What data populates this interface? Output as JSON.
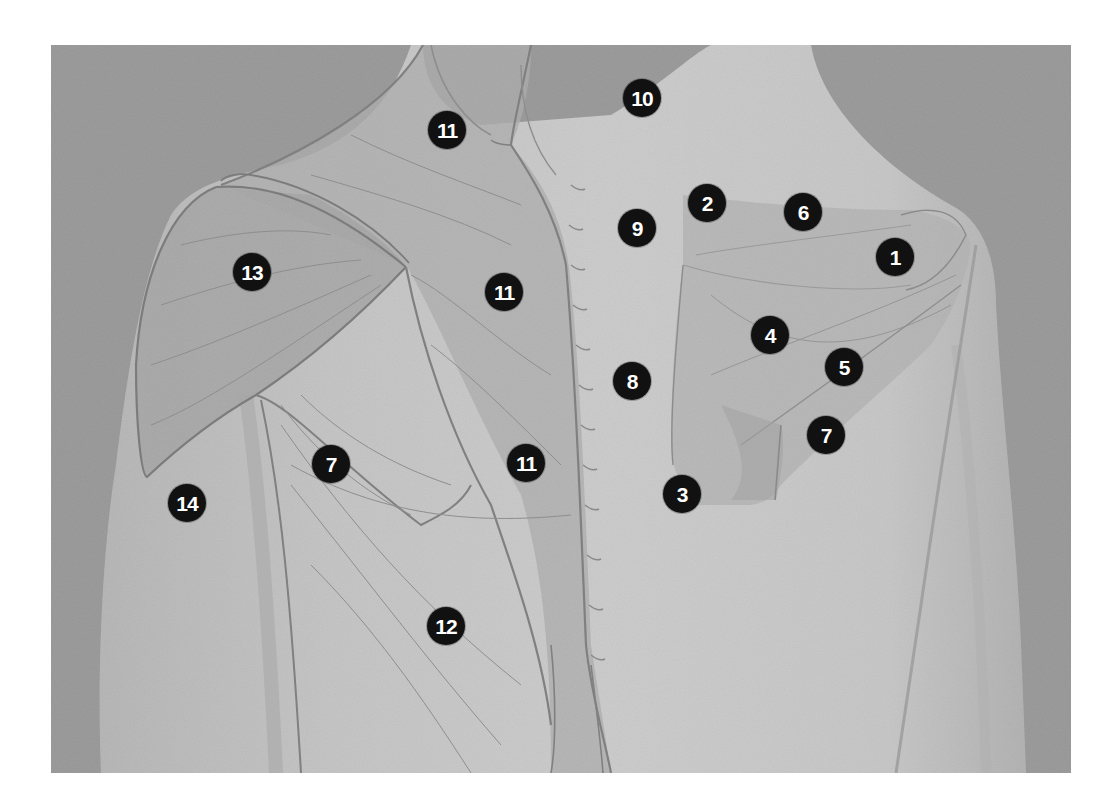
{
  "figure": {
    "colors": {
      "background": "#9c9c9c",
      "skin": "#c4c4c4",
      "skin_light": "#d2d2d2",
      "muscle_overlay": "#b2b2b2",
      "outline": "#7e7e7e",
      "marker_fill": "#111111",
      "marker_text": "#ffffff"
    }
  },
  "markers": [
    {
      "label": "1",
      "x": 844,
      "y": 212
    },
    {
      "label": "2",
      "x": 656,
      "y": 158
    },
    {
      "label": "3",
      "x": 631,
      "y": 449
    },
    {
      "label": "4",
      "x": 719,
      "y": 290
    },
    {
      "label": "5",
      "x": 793,
      "y": 322
    },
    {
      "label": "6",
      "x": 752,
      "y": 167
    },
    {
      "label": "7",
      "x": 775,
      "y": 390
    },
    {
      "label": "7",
      "x": 280,
      "y": 419
    },
    {
      "label": "8",
      "x": 581,
      "y": 336
    },
    {
      "label": "9",
      "x": 586,
      "y": 183
    },
    {
      "label": "10",
      "x": 591,
      "y": 53
    },
    {
      "label": "11",
      "x": 396,
      "y": 85
    },
    {
      "label": "11",
      "x": 453,
      "y": 247
    },
    {
      "label": "11",
      "x": 475,
      "y": 418
    },
    {
      "label": "12",
      "x": 395,
      "y": 581
    },
    {
      "label": "13",
      "x": 201,
      "y": 227
    },
    {
      "label": "14",
      "x": 136,
      "y": 458
    }
  ]
}
